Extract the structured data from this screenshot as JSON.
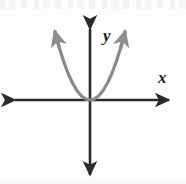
{
  "figure": {
    "background_color": "#fdfdfd",
    "width": 186,
    "height": 184
  },
  "axes": {
    "color": "#2a2a2a",
    "stroke_width": 2.6,
    "origin": {
      "x": 90,
      "y": 100
    },
    "x_axis": {
      "label": "x",
      "label_position": {
        "x": 162,
        "y": 80
      },
      "start": {
        "x": 12,
        "y": 100
      },
      "end": {
        "x": 172,
        "y": 100
      },
      "arrow_start": true,
      "arrow_end": true
    },
    "y_axis": {
      "label": "y",
      "label_position": {
        "x": 103,
        "y": 40
      },
      "start": {
        "x": 90,
        "y": 26
      },
      "end": {
        "x": 90,
        "y": 178
      },
      "arrow_start": true,
      "arrow_end": true
    }
  },
  "chart_data": {
    "type": "line",
    "xlabel": "x",
    "ylabel": "y",
    "grid": false,
    "legend": null,
    "curve_color": "#8a8a8a",
    "curve_stroke_width": 3.2,
    "equation": "y = a*x^2, a > 0",
    "vertex": {
      "x": 0,
      "y": 0
    },
    "opens": "up",
    "series": [
      {
        "name": "parabola",
        "x": [
          -2.0,
          -1.75,
          -1.5,
          -1.25,
          -1.0,
          -0.75,
          -0.5,
          -0.25,
          0,
          0.25,
          0.5,
          0.75,
          1.0,
          1.25,
          1.5,
          1.75,
          2.0
        ],
        "values": [
          4.0,
          3.06,
          2.25,
          1.56,
          1.0,
          0.56,
          0.25,
          0.06,
          0,
          0.06,
          0.25,
          0.56,
          1.0,
          1.56,
          2.25,
          3.06,
          4.0
        ]
      }
    ],
    "xlim": [
      -2.3,
      2.3
    ],
    "ylim": [
      -1.0,
      4.4
    ],
    "endpoint_arrows": [
      {
        "side": "left",
        "x": 55,
        "y": 32
      },
      {
        "side": "right",
        "x": 125,
        "y": 32
      }
    ]
  }
}
